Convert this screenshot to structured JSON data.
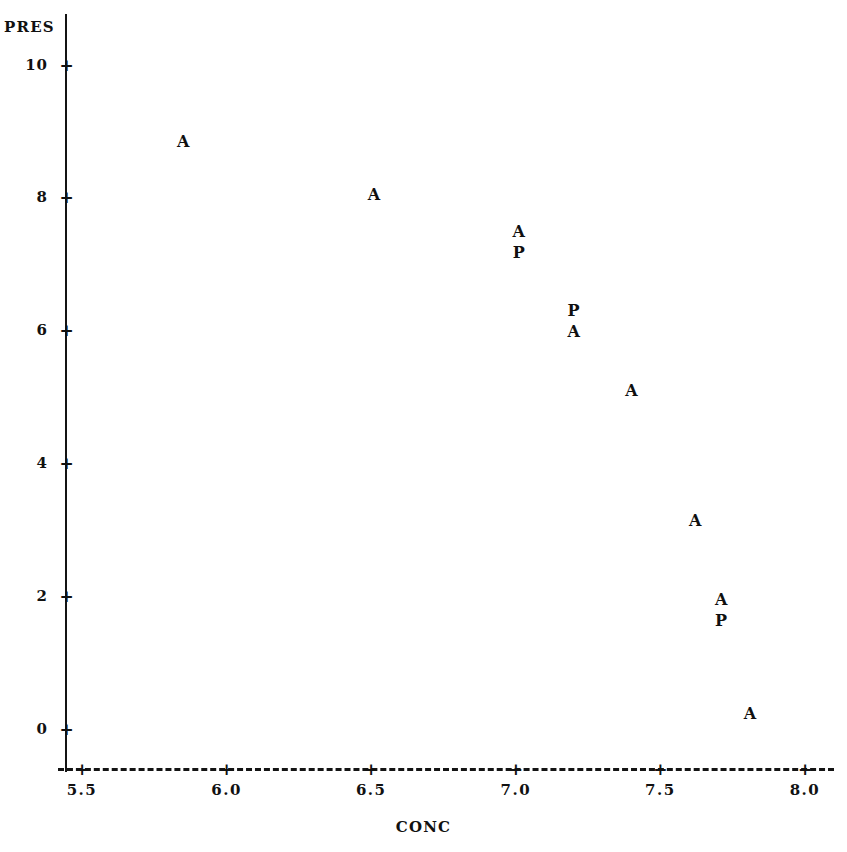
{
  "chart_data": {
    "type": "scatter",
    "title": "",
    "xlabel": "CONC",
    "ylabel": "PRES",
    "xlim": [
      5.37,
      8.06
    ],
    "ylim": [
      -0.62,
      10.6
    ],
    "grid": false,
    "legend": null,
    "xticks": [
      "5.5",
      "6.0",
      "6.5",
      "7.0",
      "7.5",
      "8.0"
    ],
    "xtick_values": [
      5.5,
      6.0,
      6.5,
      7.0,
      7.5,
      8.0
    ],
    "yticks": [
      "0",
      "2",
      "4",
      "6",
      "8",
      "10"
    ],
    "ytick_values": [
      0,
      2,
      4,
      6,
      8,
      10
    ],
    "tick_glyph": "+",
    "series": [
      {
        "name": "A",
        "marker": "A",
        "points": [
          {
            "x": 5.85,
            "y": 8.84
          },
          {
            "x": 6.51,
            "y": 8.04
          },
          {
            "x": 7.01,
            "y": 7.49
          },
          {
            "x": 7.2,
            "y": 5.98
          },
          {
            "x": 7.4,
            "y": 5.09
          },
          {
            "x": 7.62,
            "y": 3.13
          },
          {
            "x": 7.71,
            "y": 1.94
          },
          {
            "x": 7.81,
            "y": 0.23
          }
        ]
      },
      {
        "name": "P",
        "marker": "P",
        "points": [
          {
            "x": 7.01,
            "y": 7.17
          },
          {
            "x": 7.2,
            "y": 6.3
          },
          {
            "x": 7.71,
            "y": 1.63
          }
        ]
      }
    ]
  },
  "axes": {
    "y_title": "PRES",
    "x_title": "CONC"
  }
}
